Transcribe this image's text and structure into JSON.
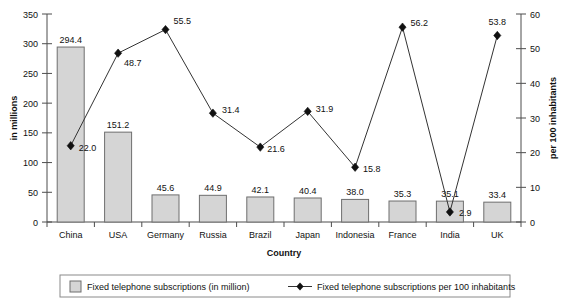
{
  "chart_data": {
    "type": "bar",
    "title": "",
    "subtitle": "",
    "xlabel": "Country",
    "ylabel": "in millions",
    "y2label": "per 100 inhabitants",
    "categories": [
      "China",
      "USA",
      "Germany",
      "Russia",
      "Brazil",
      "Japan",
      "Indonesia",
      "France",
      "India",
      "UK"
    ],
    "ylim": [
      0,
      350
    ],
    "y2lim": [
      0,
      60
    ],
    "yticks": [
      0,
      50,
      100,
      150,
      200,
      250,
      300,
      350
    ],
    "y2ticks": [
      0,
      10,
      20,
      30,
      40,
      50,
      60
    ],
    "grid": false,
    "legend_position": "bottom",
    "series": [
      {
        "name": "Fixed telephone subscriptions (in million)",
        "type": "bar",
        "axis": "left",
        "values": [
          294.4,
          151.2,
          45.6,
          44.9,
          42.1,
          40.4,
          38.0,
          35.3,
          35.1,
          33.4
        ],
        "labels": [
          "294.4",
          "151.2",
          "45.6",
          "44.9",
          "42.1",
          "40.4",
          "38.0",
          "35.3",
          "35.1",
          "33.4"
        ],
        "color": "#d5d5d5",
        "border_color": "#6e6e6e"
      },
      {
        "name": "Fixed telephone subscriptions per 100 inhabitants",
        "type": "line",
        "axis": "right",
        "values": [
          22.0,
          48.7,
          55.5,
          31.4,
          21.6,
          31.9,
          15.8,
          56.2,
          2.9,
          53.8
        ],
        "labels": [
          "22.0",
          "48.7",
          "55.5",
          "31.4",
          "21.6",
          "31.9",
          "15.8",
          "56.2",
          "2.9",
          "53.8"
        ],
        "color": "#333333",
        "marker": "diamond"
      }
    ],
    "legend": [
      {
        "label": "Fixed telephone subscriptions (in million)",
        "marker": "square-swatch"
      },
      {
        "label": "Fixed telephone subscriptions per 100 inhabitants",
        "marker": "line-diamond"
      }
    ]
  }
}
